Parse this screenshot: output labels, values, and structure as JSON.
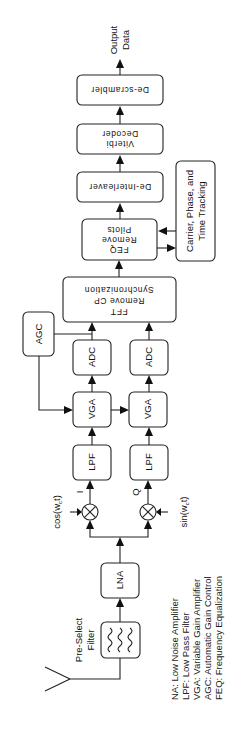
{
  "diagram": {
    "output": {
      "line1": "Output",
      "line2": "Data"
    },
    "blocks": {
      "descrambler": "De-scrambler",
      "viterbi": {
        "line1": "Viterbi",
        "line2": "Decoder"
      },
      "deinterleaver": "De-Interleaver",
      "feq": {
        "line1": "FEQ",
        "line2": "Remove",
        "line3": "Pilots"
      },
      "tracking": {
        "line1": "Carrier, Phase, and",
        "line2": "Time Tracking"
      },
      "sync": {
        "line1": "Synchronization",
        "line2": "Remove CP",
        "line3": "FFT"
      },
      "agc": "AGC",
      "adc_i": "ADC",
      "adc_q": "ADC",
      "vga_i": "VGA",
      "vga_q": "VGA",
      "lpf_i": "LPF",
      "lpf_q": "LPF",
      "lna": "LNA",
      "filter": {
        "line1": "Pre-Select",
        "line2": "Filter"
      }
    },
    "signals": {
      "i_label": "I",
      "q_label": "Q",
      "cos_label": "cos(w",
      "cos_sub": "c",
      "cos_tail": "t)",
      "sin_label": "sin(w",
      "sin_sub": "c",
      "sin_tail": "t)"
    },
    "legend": [
      "NA: Low Noise Amplifier",
      "LPF: Low Pass Filter",
      "VGA: Variable Gain Amplifier",
      "AGC: Automatic Gain Control",
      "FEQ: Frequency Equalization"
    ]
  }
}
